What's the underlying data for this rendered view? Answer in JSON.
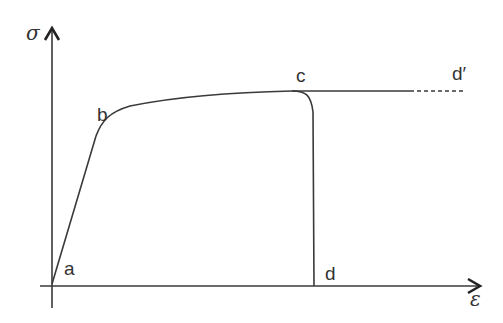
{
  "diagram": {
    "type": "stress-strain curve",
    "axes": {
      "y_label": "σ",
      "x_label": "ε"
    },
    "points": {
      "a": "a",
      "b": "b",
      "c": "c",
      "d": "d",
      "d_prime": "d′"
    },
    "colors": {
      "line": "#3a3a3a",
      "text": "#333333",
      "background": "#ffffff"
    }
  }
}
